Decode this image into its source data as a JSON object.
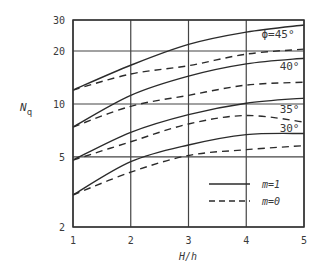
{
  "chart_data": {
    "type": "line",
    "title": "",
    "xlabel": "H/h",
    "ylabel": "Nq",
    "ylabel_main": "N",
    "ylabel_sub": "q",
    "xscale": "linear",
    "yscale": "log",
    "xlim": [
      1,
      5
    ],
    "ylim": [
      2,
      30
    ],
    "grid": true,
    "x_ticks": [
      1,
      2,
      3,
      4,
      5
    ],
    "y_ticks": [
      2,
      5,
      10,
      20,
      30
    ],
    "x": [
      1,
      2,
      3,
      4,
      5
    ],
    "series": [
      {
        "name": "φ=45°, m=1",
        "phi": "45°",
        "m": 1,
        "style": "solid",
        "values": [
          12.0,
          16.6,
          21.8,
          25.6,
          28.1
        ]
      },
      {
        "name": "φ=45°, m=0",
        "phi": "45°",
        "m": 0,
        "style": "dashed",
        "values": [
          12.0,
          14.8,
          16.5,
          19.2,
          20.5
        ]
      },
      {
        "name": "φ=40°, m=1",
        "phi": "40°",
        "m": 1,
        "style": "solid",
        "values": [
          7.4,
          11.2,
          14.4,
          16.9,
          18.2
        ]
      },
      {
        "name": "φ=40°, m=0",
        "phi": "40°",
        "m": 0,
        "style": "dashed",
        "values": [
          7.4,
          9.7,
          11.2,
          12.8,
          13.3
        ]
      },
      {
        "name": "φ=35°, m=1",
        "phi": "35°",
        "m": 1,
        "style": "solid",
        "values": [
          4.8,
          6.9,
          8.7,
          10.1,
          10.8
        ]
      },
      {
        "name": "φ=35°, m=0",
        "phi": "35°",
        "m": 0,
        "style": "dashed",
        "values": [
          4.8,
          6.1,
          7.7,
          8.6,
          7.9
        ]
      },
      {
        "name": "φ=30°, m=1",
        "phi": "30°",
        "m": 1,
        "style": "solid",
        "values": [
          3.04,
          4.7,
          5.85,
          6.7,
          6.8
        ]
      },
      {
        "name": "φ=30°, m=0",
        "phi": "30°",
        "m": 0,
        "style": "dashed",
        "values": [
          3.04,
          4.1,
          5.1,
          5.5,
          5.8
        ]
      }
    ],
    "curve_labels": [
      {
        "text": "ϕ=45°",
        "x": 4.55,
        "y": 23.8
      },
      {
        "text": "40°",
        "x": 4.75,
        "y": 15.6
      },
      {
        "text": "35°",
        "x": 4.75,
        "y": 8.9
      },
      {
        "text": "30°",
        "x": 4.75,
        "y": 6.9
      }
    ],
    "legend": {
      "position": "lower right",
      "entries": [
        {
          "label": "m=1",
          "style": "solid"
        },
        {
          "label": "m=0",
          "style": "dashed"
        }
      ]
    }
  },
  "colors": {
    "line": "#2b2b2b",
    "frame": "#333333",
    "background": "#ffffff"
  }
}
